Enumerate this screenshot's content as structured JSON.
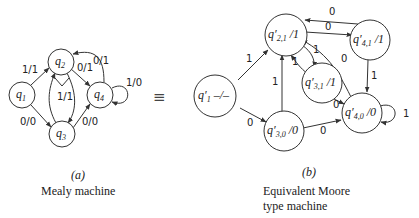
{
  "figure_a": {
    "caption_tag": "(a)",
    "caption": "Mealy machine",
    "states": [
      {
        "id": "q1",
        "label": "q",
        "sub": "1"
      },
      {
        "id": "q2",
        "label": "q",
        "sub": "2"
      },
      {
        "id": "q3",
        "label": "q",
        "sub": "3"
      },
      {
        "id": "q4",
        "label": "q",
        "sub": "4"
      }
    ],
    "transitions": [
      {
        "from": "q1",
        "to": "q2",
        "label": "1/1"
      },
      {
        "from": "q1",
        "to": "q3",
        "label": "0/0"
      },
      {
        "from": "q2",
        "to": "q4",
        "label": "0/1"
      },
      {
        "from": "q4",
        "to": "q2",
        "label": "0/1"
      },
      {
        "from": "q2",
        "to": "q3",
        "label": "1/1"
      },
      {
        "from": "q3",
        "to": "q2",
        "label": "1/1"
      },
      {
        "from": "q3",
        "to": "q4",
        "label": "0/0"
      },
      {
        "from": "q4",
        "to": "q4",
        "label": "1/0"
      }
    ]
  },
  "equivalence_symbol": "≡",
  "figure_b": {
    "caption_tag": "(b)",
    "caption_line1": "Equivalent Moore",
    "caption_line2": "type machine",
    "states": [
      {
        "id": "q1p",
        "label": "q′",
        "sub": "1",
        "output": " –/–"
      },
      {
        "id": "q21",
        "label": "q′",
        "sub": "2,1",
        "output": " /1"
      },
      {
        "id": "q41",
        "label": "q′",
        "sub": "4,1",
        "output": " /1"
      },
      {
        "id": "q31",
        "label": "q′",
        "sub": "3,1",
        "output": " /1"
      },
      {
        "id": "q40",
        "label": "q′",
        "sub": "4,0",
        "output": " /0"
      },
      {
        "id": "q30",
        "label": "q′",
        "sub": "3,0",
        "output": " /0"
      }
    ],
    "transitions": [
      {
        "from": "q1p",
        "to": "q21",
        "label": "1"
      },
      {
        "from": "q1p",
        "to": "q30",
        "label": "0"
      },
      {
        "from": "q21",
        "to": "q41",
        "label": "0"
      },
      {
        "from": "q41",
        "to": "q21",
        "label": "0"
      },
      {
        "from": "q21",
        "to": "q31",
        "label": "1"
      },
      {
        "from": "q31",
        "to": "q21",
        "label": "1"
      },
      {
        "from": "q40",
        "to": "q21",
        "label": "0"
      },
      {
        "from": "q41",
        "to": "q40",
        "label": "1"
      },
      {
        "from": "q31",
        "to": "q40",
        "label": "0"
      },
      {
        "from": "q30",
        "to": "q21",
        "label": "1"
      },
      {
        "from": "q30",
        "to": "q40",
        "label": "0"
      },
      {
        "from": "q40",
        "to": "q40",
        "label": "1"
      }
    ]
  }
}
